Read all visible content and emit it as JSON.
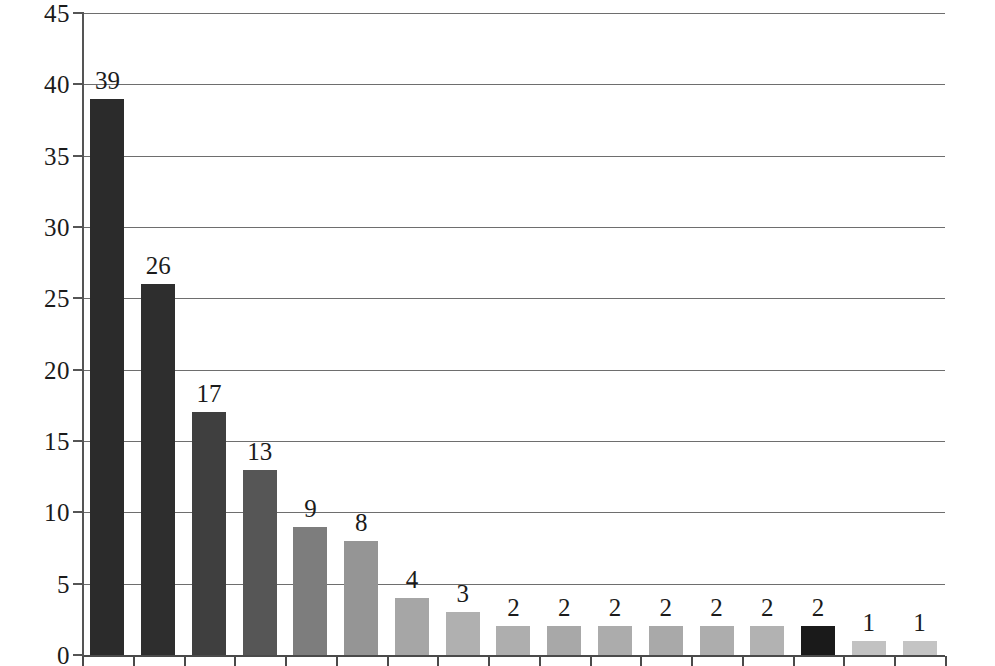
{
  "chart_data": {
    "type": "bar",
    "title": "",
    "subtitle": "",
    "xlabel": "",
    "ylabel": "",
    "ylim": [
      0,
      45
    ],
    "y_ticks": [
      0,
      5,
      10,
      15,
      20,
      25,
      30,
      35,
      40,
      45
    ],
    "grid": true,
    "legend": null,
    "categories": [
      "1",
      "2",
      "3",
      "4",
      "5",
      "6",
      "7",
      "8",
      "9",
      "10",
      "11",
      "12",
      "13",
      "14",
      "15",
      "16",
      "17"
    ],
    "values": [
      39,
      26,
      17,
      13,
      9,
      8,
      4,
      3,
      2,
      2,
      2,
      2,
      2,
      2,
      2,
      1,
      1
    ],
    "data_labels": [
      "39",
      "26",
      "17",
      "13",
      "9",
      "8",
      "4",
      "3",
      "2",
      "2",
      "2",
      "2",
      "2",
      "2",
      "2",
      "1",
      "1"
    ],
    "bar_colors": [
      "#2b2b2b",
      "#2e2e2e",
      "#3f3f3f",
      "#565656",
      "#7d7d7d",
      "#959595",
      "#a6a6a6",
      "#b0b0b0",
      "#aeaeae",
      "#a8a8a8",
      "#acacac",
      "#a9a9a9",
      "#adadad",
      "#b2b2b2",
      "#1a1a1a",
      "#c2c2c2",
      "#c4c4c4"
    ]
  },
  "axis": {
    "y_tick_labels": [
      "45",
      "40",
      "35",
      "30",
      "25",
      "20",
      "15",
      "10",
      "5",
      "0"
    ],
    "grid_color": "#6e6e6e",
    "axis_color": "#4a4a4a",
    "text_color": "#1b1b1b"
  }
}
